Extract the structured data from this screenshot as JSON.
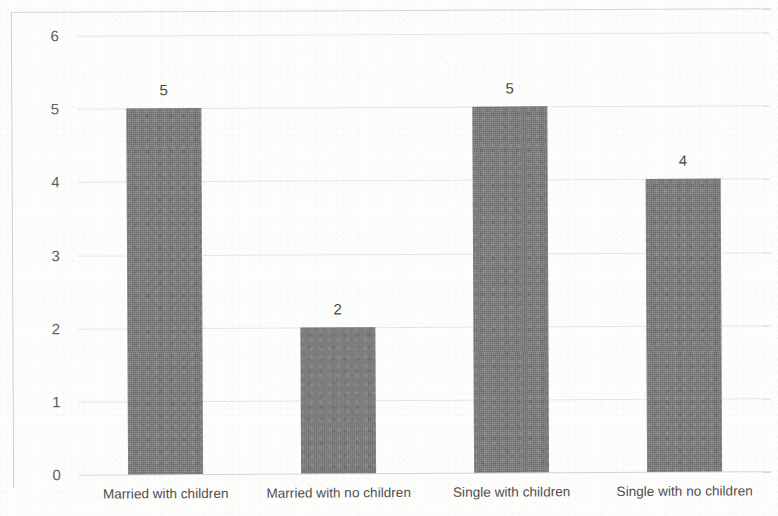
{
  "chart_data": {
    "type": "bar",
    "title": "",
    "subtitle": "",
    "xlabel": "",
    "ylabel": "",
    "categories": [
      "Married with children",
      "Married with no children",
      "Single with children",
      "Single with no children"
    ],
    "values": [
      5,
      2,
      5,
      4
    ],
    "data_labels": [
      "5",
      "2",
      "5",
      "4"
    ],
    "ylim": [
      0,
      6
    ],
    "yticks": [
      0,
      1,
      2,
      3,
      4,
      5,
      6
    ],
    "ytick_labels": [
      "0",
      "1",
      "2",
      "3",
      "4",
      "5",
      "6"
    ],
    "grid": true,
    "grid_axis": "y",
    "legend": false,
    "legend_position": "none",
    "bar_color": "#7d7d7d",
    "grid_color": "#e6e6e6",
    "axis_color": "#cfcfcf",
    "background_color": "#fdfdfc",
    "text_color": "#4f4f4f"
  }
}
